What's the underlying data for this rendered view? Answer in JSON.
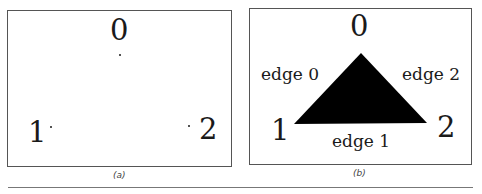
{
  "figure": {
    "panel_a": {
      "caption": "(a)",
      "vertices": [
        {
          "label": "0",
          "x": 120,
          "y": 55
        },
        {
          "label": "1",
          "x": 51,
          "y": 126
        },
        {
          "label": "2",
          "x": 188,
          "y": 125
        }
      ]
    },
    "panel_b": {
      "caption": "(b)",
      "vertices": [
        {
          "label": "0",
          "x": 361,
          "y": 53
        },
        {
          "label": "1",
          "x": 294,
          "y": 124
        },
        {
          "label": "2",
          "x": 427,
          "y": 123
        }
      ],
      "edges": [
        {
          "label": "edge 0"
        },
        {
          "label": "edge 1"
        },
        {
          "label": "edge 2"
        }
      ],
      "fill_color": "#000000"
    }
  }
}
